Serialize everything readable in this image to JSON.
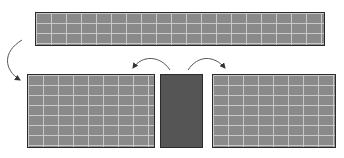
{
  "diagram": {
    "elements": [
      {
        "id": "top-wall",
        "type": "brick-wall",
        "x": 35,
        "y": 12,
        "w": 290,
        "h": 34
      },
      {
        "id": "left-wall",
        "type": "brick-wall",
        "x": 27,
        "y": 74,
        "w": 128,
        "h": 74
      },
      {
        "id": "dark-block",
        "type": "solid-block",
        "x": 160,
        "y": 74,
        "w": 43,
        "h": 74
      },
      {
        "id": "right-wall",
        "type": "brick-wall",
        "x": 212,
        "y": 74,
        "w": 124,
        "h": 74
      }
    ],
    "arrows": [
      {
        "id": "arrow-top-to-left",
        "from": "top-wall",
        "to": "left-wall"
      },
      {
        "id": "arrow-block-to-left",
        "from": "dark-block",
        "to": "left-wall"
      },
      {
        "id": "arrow-block-to-right",
        "from": "dark-block",
        "to": "right-wall"
      }
    ],
    "colors": {
      "brick": "#8a8a8a",
      "mortar": "#c8c8c8",
      "block": "#555555",
      "outline": "#2a2a2a",
      "arrow": "#333333"
    }
  }
}
